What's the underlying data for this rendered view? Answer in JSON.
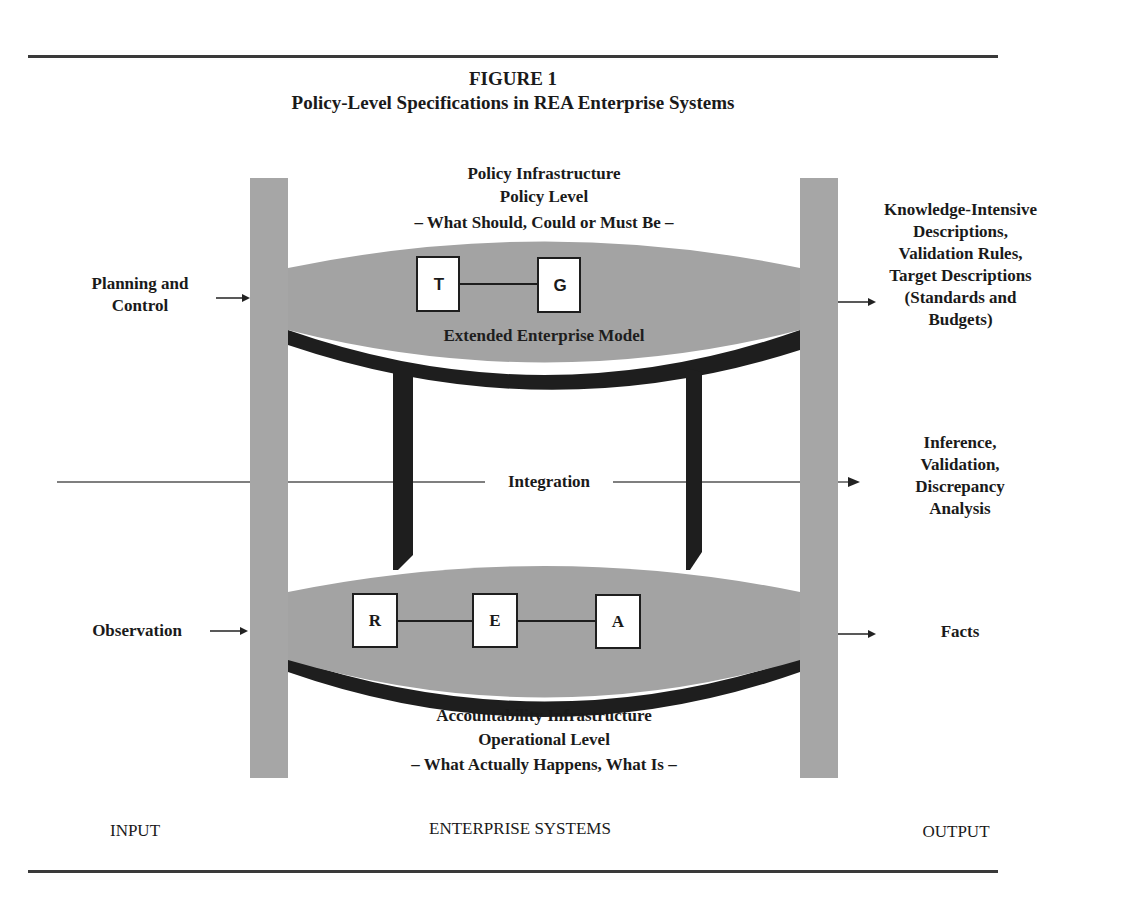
{
  "figure": {
    "number": "FIGURE 1",
    "title": "Policy-Level Specifications in REA Enterprise Systems"
  },
  "policy": {
    "line1": "Policy Infrastructure",
    "line2": "Policy Level",
    "line3": "– What Should, Could  or Must Be –",
    "model_label": "Extended Enterprise Model",
    "boxes": [
      "T",
      "G"
    ]
  },
  "operational": {
    "boxes": [
      "R",
      "E",
      "A"
    ],
    "line1": "Accountability Infrastructure",
    "line2": "Operational Level",
    "line3": "– What Actually  Happens, What Is –"
  },
  "integration": {
    "label": "Integration"
  },
  "inputs": {
    "planning": [
      "Planning and",
      "Control"
    ],
    "observation": "Observation"
  },
  "outputs": {
    "knowledge": [
      "Knowledge-Intensive",
      "Descriptions,",
      "Validation Rules,",
      "Target Descriptions",
      "(Standards and",
      "Budgets)"
    ],
    "inference": [
      "Inference,",
      "Validation,",
      "Discrepancy",
      "Analysis"
    ],
    "facts": "Facts"
  },
  "footer": {
    "input": "INPUT",
    "systems": "ENTERPRISE SYSTEMS",
    "output": "OUTPUT"
  },
  "colors": {
    "pillar": "#a6a6a6",
    "disc": "#a3a3a3",
    "shadow": "#1e1e1e",
    "rule": "#3a3a3a"
  }
}
